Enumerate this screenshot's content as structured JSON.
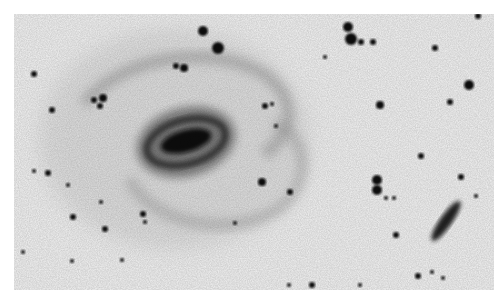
{
  "image": {
    "subject": "negative grayscale astronomical image of a barred spiral galaxy with field stars and an edge-on companion galaxy",
    "background_color": "#f3f3f3",
    "ink_color": "#111111"
  },
  "galaxy": {
    "cx": 175,
    "cy": 130,
    "bar_angle": -15
  },
  "companion": {
    "cx": 432,
    "cy": 207,
    "angle": -55
  },
  "stars": [
    [
      189,
      17,
      5
    ],
    [
      204,
      34,
      6
    ],
    [
      334,
      13,
      5
    ],
    [
      337,
      25,
      6
    ],
    [
      347,
      28,
      3
    ],
    [
      359,
      28,
      3
    ],
    [
      464,
      2,
      3
    ],
    [
      421,
      34,
      3
    ],
    [
      366,
      91,
      4
    ],
    [
      455,
      71,
      5
    ],
    [
      436,
      88,
      3
    ],
    [
      20,
      60,
      3
    ],
    [
      38,
      96,
      3
    ],
    [
      80,
      86,
      3
    ],
    [
      89,
      84,
      4
    ],
    [
      86,
      92,
      3
    ],
    [
      251,
      92,
      3
    ],
    [
      170,
      54,
      4
    ],
    [
      162,
      52,
      3
    ],
    [
      248,
      168,
      4
    ],
    [
      262,
      112,
      2
    ],
    [
      276,
      178,
      3
    ],
    [
      311,
      43,
      2
    ],
    [
      258,
      90,
      2
    ],
    [
      363,
      166,
      5
    ],
    [
      363,
      176,
      5
    ],
    [
      372,
      184,
      2
    ],
    [
      380,
      184,
      2
    ],
    [
      407,
      142,
      3
    ],
    [
      447,
      163,
      3
    ],
    [
      462,
      182,
      2
    ],
    [
      404,
      262,
      3
    ],
    [
      418,
      258,
      2
    ],
    [
      429,
      264,
      2
    ],
    [
      382,
      221,
      3
    ],
    [
      346,
      271,
      2
    ],
    [
      298,
      271,
      3
    ],
    [
      275,
      271,
      2
    ],
    [
      34,
      159,
      3
    ],
    [
      59,
      203,
      3
    ],
    [
      87,
      188,
      2
    ],
    [
      9,
      238,
      2
    ],
    [
      58,
      247,
      2
    ],
    [
      91,
      215,
      3
    ],
    [
      129,
      200,
      3
    ],
    [
      131,
      208,
      2
    ],
    [
      221,
      209,
      2
    ],
    [
      54,
      171,
      2
    ],
    [
      20,
      157,
      2
    ],
    [
      108,
      246,
      2
    ]
  ]
}
